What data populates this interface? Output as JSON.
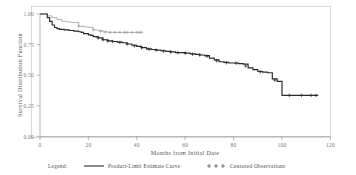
{
  "chart_data": {
    "type": "line",
    "title": "",
    "subtitle": "",
    "xlabel": "Months from Initial Date",
    "ylabel": "Survival Distribution Function",
    "xlim": [
      0,
      120
    ],
    "ylim": [
      0.0,
      1.0
    ],
    "xticks": [
      0,
      20,
      40,
      60,
      80,
      100,
      120
    ],
    "xtick_labels": [
      "0",
      "20",
      "40",
      "60",
      "80",
      "100",
      "120"
    ],
    "yticks": [
      0.0,
      0.25,
      0.5,
      0.75,
      1.0
    ],
    "ytick_labels": [
      "0.00",
      "0.25",
      "0.50",
      "0.75",
      "1.00"
    ],
    "grid": false,
    "legend_position": "below-axes",
    "legend_title": "Legend:",
    "step_type": "post",
    "series": [
      {
        "name": "Product-Limit Estimate Curve",
        "role": "primary",
        "color": "#2a2a2a",
        "style": "step-solid",
        "x": [
          0,
          2,
          3,
          4,
          5,
          6,
          7,
          8,
          10,
          12,
          14,
          16,
          17,
          18,
          20,
          21,
          22,
          24,
          26,
          28,
          30,
          32,
          34,
          36,
          38,
          40,
          42,
          44,
          46,
          48,
          50,
          52,
          54,
          56,
          58,
          60,
          62,
          64,
          66,
          68,
          70,
          72,
          74,
          76,
          78,
          80,
          82,
          84,
          86,
          88,
          90,
          92,
          94,
          96,
          98,
          100,
          104,
          108,
          112,
          115
        ],
        "y": [
          1.0,
          1.0,
          0.97,
          0.94,
          0.91,
          0.89,
          0.88,
          0.875,
          0.87,
          0.865,
          0.86,
          0.855,
          0.85,
          0.84,
          0.83,
          0.825,
          0.815,
          0.805,
          0.79,
          0.78,
          0.775,
          0.77,
          0.765,
          0.755,
          0.745,
          0.735,
          0.725,
          0.715,
          0.71,
          0.705,
          0.7,
          0.695,
          0.69,
          0.685,
          0.685,
          0.68,
          0.675,
          0.67,
          0.665,
          0.66,
          0.64,
          0.625,
          0.61,
          0.605,
          0.6,
          0.6,
          0.595,
          0.59,
          0.56,
          0.545,
          0.53,
          0.525,
          0.52,
          0.47,
          0.45,
          0.335,
          0.335,
          0.335,
          0.335,
          0.335
        ]
      },
      {
        "name": "Product-Limit Estimate Curve (second group)",
        "role": "secondary",
        "color": "#9d9d9d",
        "style": "step-solid",
        "x": [
          0,
          3,
          5,
          7,
          9,
          11,
          13,
          15,
          16,
          18,
          20,
          22,
          24,
          26,
          28,
          30,
          32,
          34,
          36,
          38,
          40,
          42
        ],
        "y": [
          1.0,
          0.985,
          0.97,
          0.955,
          0.94,
          0.935,
          0.93,
          0.93,
          0.9,
          0.895,
          0.89,
          0.87,
          0.865,
          0.855,
          0.85,
          0.85,
          0.85,
          0.85,
          0.85,
          0.85,
          0.85,
          0.85
        ]
      }
    ],
    "censored": {
      "name": "Censored Observations",
      "marker": "+",
      "primary_points": [
        {
          "x": 24,
          "y": 0.805
        },
        {
          "x": 26,
          "y": 0.79
        },
        {
          "x": 28,
          "y": 0.78
        },
        {
          "x": 30,
          "y": 0.775
        },
        {
          "x": 33,
          "y": 0.768
        },
        {
          "x": 36,
          "y": 0.755
        },
        {
          "x": 39,
          "y": 0.74
        },
        {
          "x": 42,
          "y": 0.725
        },
        {
          "x": 45,
          "y": 0.712
        },
        {
          "x": 48,
          "y": 0.705
        },
        {
          "x": 51,
          "y": 0.697
        },
        {
          "x": 54,
          "y": 0.69
        },
        {
          "x": 57,
          "y": 0.685
        },
        {
          "x": 60,
          "y": 0.68
        },
        {
          "x": 63,
          "y": 0.672
        },
        {
          "x": 66,
          "y": 0.665
        },
        {
          "x": 69,
          "y": 0.655
        },
        {
          "x": 73,
          "y": 0.618
        },
        {
          "x": 77,
          "y": 0.602
        },
        {
          "x": 81,
          "y": 0.598
        },
        {
          "x": 85,
          "y": 0.575
        },
        {
          "x": 91,
          "y": 0.528
        },
        {
          "x": 97,
          "y": 0.46
        },
        {
          "x": 103,
          "y": 0.335
        },
        {
          "x": 108,
          "y": 0.335
        },
        {
          "x": 112,
          "y": 0.335
        },
        {
          "x": 114,
          "y": 0.335
        }
      ],
      "secondary_points": [
        {
          "x": 16,
          "y": 0.9
        },
        {
          "x": 22,
          "y": 0.87
        },
        {
          "x": 25,
          "y": 0.858
        },
        {
          "x": 27,
          "y": 0.852
        },
        {
          "x": 29,
          "y": 0.85
        },
        {
          "x": 31,
          "y": 0.85
        },
        {
          "x": 33,
          "y": 0.85
        },
        {
          "x": 35,
          "y": 0.85
        },
        {
          "x": 36,
          "y": 0.85
        },
        {
          "x": 38,
          "y": 0.85
        },
        {
          "x": 40,
          "y": 0.85
        },
        {
          "x": 41,
          "y": 0.85
        },
        {
          "x": 42,
          "y": 0.85
        }
      ]
    }
  },
  "legend": {
    "title": "Legend:",
    "entries": [
      {
        "label": "Product-Limit Estimate Curve",
        "marker": "line",
        "color": "#2a2a2a"
      },
      {
        "label": "Censored Observations",
        "marker": "plus",
        "color": "#4a4a4a"
      }
    ]
  },
  "axes": {
    "x_title": "Months from Initial Date",
    "y_title": "Survival Distribution Function"
  }
}
